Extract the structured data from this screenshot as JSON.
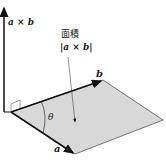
{
  "diagram": {
    "labels": {
      "cross": "a × b",
      "area_title": "面積",
      "area_expr": "|a × b|",
      "vec_a": "a",
      "vec_b": "b",
      "angle": "θ"
    },
    "colors": {
      "parallelogram_fill": "#d8d8d8",
      "lines": "#111111"
    }
  }
}
